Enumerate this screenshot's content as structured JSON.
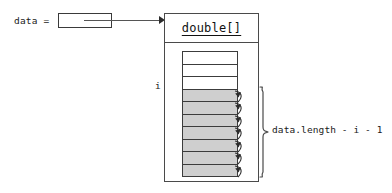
{
  "diagram": {
    "variable": {
      "label": "data =",
      "box_value": "",
      "pointer_icon": "arrow-right-icon"
    },
    "object": {
      "type_name": "double[]",
      "index_label": "i"
    },
    "array": {
      "cell_count": 10,
      "empty_count": 3,
      "filled_count": 7,
      "cells": [
        {
          "state": "empty",
          "has_swap_arrow": false
        },
        {
          "state": "empty",
          "has_swap_arrow": false
        },
        {
          "state": "empty",
          "has_swap_arrow": false
        },
        {
          "state": "filled",
          "has_swap_arrow": true
        },
        {
          "state": "filled",
          "has_swap_arrow": true
        },
        {
          "state": "filled",
          "has_swap_arrow": true
        },
        {
          "state": "filled",
          "has_swap_arrow": true
        },
        {
          "state": "filled",
          "has_swap_arrow": true
        },
        {
          "state": "filled",
          "has_swap_arrow": true
        },
        {
          "state": "filled",
          "has_swap_arrow": true
        }
      ]
    },
    "annotation": {
      "brace_icon": "curly-brace-right-icon",
      "text": "data.length - i - 1"
    },
    "colors": {
      "filled_cell": "#cfcfcf",
      "empty_cell": "#ffffff",
      "stroke": "#3c3c3c",
      "text": "#1a1a1a"
    }
  }
}
